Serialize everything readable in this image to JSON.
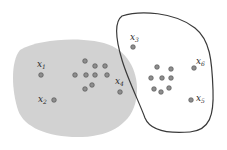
{
  "diagram": {
    "colors": {
      "background": "#ffffff",
      "left_region_fill": "#d2d2d2",
      "right_region_stroke": "#3a3a3a",
      "point_fill": "#8e8e8e",
      "point_stroke": "#4a4a4a",
      "label_color": "#2a2a2a"
    },
    "regions": [
      {
        "id": "left-cluster",
        "style": "filled-gray"
      },
      {
        "id": "right-cluster",
        "style": "outlined"
      }
    ],
    "labeled_points": [
      {
        "label": "x",
        "sub": "1",
        "region": "left-cluster"
      },
      {
        "label": "x",
        "sub": "2",
        "region": "left-cluster"
      },
      {
        "label": "x",
        "sub": "3",
        "region": "right-cluster"
      },
      {
        "label": "x",
        "sub": "4",
        "region": "left-cluster"
      },
      {
        "label": "x",
        "sub": "5",
        "region": "right-cluster"
      },
      {
        "label": "x",
        "sub": "6",
        "region": "right-cluster"
      }
    ],
    "unlabeled_point_counts": {
      "left-cluster": 9,
      "right-cluster": 8
    }
  }
}
